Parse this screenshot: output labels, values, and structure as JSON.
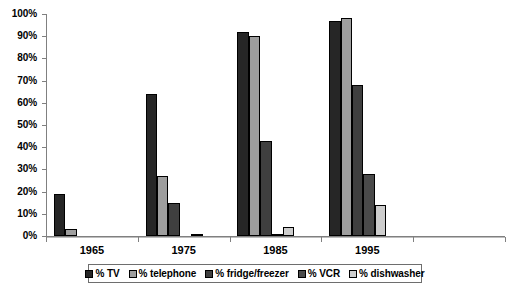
{
  "chart_data": {
    "type": "bar",
    "title": "",
    "subtitle": "",
    "xlabel": "",
    "ylabel": "",
    "categories": [
      "1965",
      "1975",
      "1985",
      "1995",
      ""
    ],
    "ylim": [
      0,
      100
    ],
    "ytick_labels": [
      "0%",
      "10%",
      "20%",
      "30%",
      "40%",
      "50%",
      "60%",
      "70%",
      "80%",
      "90%",
      "100%"
    ],
    "ytick_values": [
      0,
      10,
      20,
      30,
      40,
      50,
      60,
      70,
      80,
      90,
      100
    ],
    "grid": false,
    "legend_position": "bottom",
    "series": [
      {
        "name": "% TV",
        "color": "#262626",
        "values": [
          19,
          64,
          92,
          97,
          0
        ]
      },
      {
        "name": "% telephone",
        "color": "#9e9e9e",
        "values": [
          3,
          27,
          90,
          98,
          0
        ]
      },
      {
        "name": "% fridge/freezer",
        "color": "#3f3f3f",
        "values": [
          0,
          15,
          43,
          68,
          0
        ]
      },
      {
        "name": "% VCR",
        "color": "#4a4a4a",
        "values": [
          0,
          0,
          1,
          28,
          0
        ]
      },
      {
        "name": "% dishwasher",
        "color": "#cdcdcd",
        "values": [
          0,
          1,
          4,
          14,
          0
        ]
      }
    ]
  },
  "legend": {
    "items": [
      {
        "label": "% TV",
        "swatch": "#262626"
      },
      {
        "label": "% telephone",
        "swatch": "#9e9e9e"
      },
      {
        "label": "% fridge/freezer",
        "swatch": "#3f3f3f"
      },
      {
        "label": "% VCR",
        "swatch": "#4a4a4a"
      },
      {
        "label": "% dishwasher",
        "swatch": "#cdcdcd"
      }
    ]
  },
  "colors": {
    "axis": "#808080",
    "bar_outline": "#000000",
    "background": "#ffffff",
    "text": "#000000"
  }
}
